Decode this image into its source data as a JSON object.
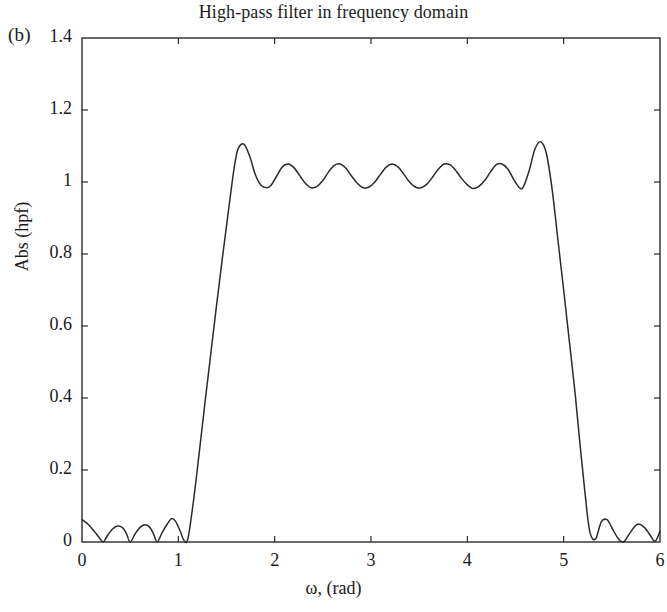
{
  "panel_label": "(b)",
  "axis_label_y": "Abs (hpf)",
  "axis_label_x": "ω, (rad)",
  "colors": {
    "line": "#2b2b2b",
    "frame": "#2b2b2b",
    "background": "#ffffff",
    "text": "#1a1a1a"
  },
  "chart_data": {
    "type": "line",
    "title": "High-pass filter in frequency domain",
    "xlabel": "ω, (rad)",
    "ylabel": "Abs (hpf)",
    "xlim": [
      0,
      6
    ],
    "ylim": [
      0,
      1.4
    ],
    "xticks": [
      0,
      1,
      2,
      3,
      4,
      5,
      6
    ],
    "xtick_labels": [
      "0",
      "1",
      "2",
      "3",
      "4",
      "5",
      "6"
    ],
    "yticks": [
      0,
      0.2,
      0.4,
      0.6,
      0.8,
      1,
      1.2,
      1.4
    ],
    "ytick_labels": [
      "0",
      "0.2",
      "0.4",
      "0.6",
      "0.8",
      "1",
      "1.2",
      "1.4"
    ],
    "grid": false,
    "legend": null,
    "series": [
      {
        "name": "Abs (hpf)",
        "x": [
          0.0,
          0.06,
          0.12,
          0.18,
          0.22,
          0.26,
          0.31,
          0.36,
          0.42,
          0.46,
          0.5,
          0.55,
          0.6,
          0.65,
          0.7,
          0.74,
          0.78,
          0.83,
          0.88,
          0.93,
          0.97,
          1.02,
          1.06,
          1.1,
          1.16,
          1.22,
          1.28,
          1.34,
          1.4,
          1.46,
          1.52,
          1.58,
          1.62,
          1.68,
          1.74,
          1.8,
          1.86,
          1.92,
          1.96,
          2.02,
          2.08,
          2.14,
          2.2,
          2.26,
          2.32,
          2.38,
          2.44,
          2.5,
          2.56,
          2.62,
          2.68,
          2.74,
          2.8,
          2.86,
          2.92,
          2.98,
          3.04,
          3.1,
          3.16,
          3.22,
          3.28,
          3.34,
          3.4,
          3.46,
          3.52,
          3.58,
          3.64,
          3.7,
          3.76,
          3.82,
          3.88,
          3.94,
          4.0,
          4.06,
          4.12,
          4.18,
          4.24,
          4.3,
          4.36,
          4.42,
          4.48,
          4.54,
          4.58,
          4.64,
          4.7,
          4.76,
          4.82,
          4.88,
          4.94,
          5.0,
          5.06,
          5.12,
          5.17,
          5.22,
          5.27,
          5.33,
          5.39,
          5.45,
          5.5,
          5.56,
          5.62,
          5.68,
          5.74,
          5.78,
          5.84,
          5.9,
          5.95,
          6.0
        ],
        "y": [
          0.062,
          0.05,
          0.032,
          0.012,
          0.0,
          0.016,
          0.034,
          0.044,
          0.04,
          0.024,
          0.0,
          0.022,
          0.04,
          0.048,
          0.042,
          0.024,
          0.0,
          0.025,
          0.048,
          0.065,
          0.058,
          0.03,
          0.004,
          0.01,
          0.12,
          0.255,
          0.395,
          0.53,
          0.665,
          0.795,
          0.92,
          1.04,
          1.092,
          1.105,
          1.072,
          1.02,
          0.99,
          0.984,
          0.99,
          1.016,
          1.042,
          1.05,
          1.04,
          1.018,
          0.996,
          0.984,
          0.988,
          1.004,
          1.028,
          1.046,
          1.05,
          1.038,
          1.016,
          0.996,
          0.984,
          0.986,
          1.0,
          1.022,
          1.042,
          1.05,
          1.042,
          1.022,
          1.0,
          0.986,
          0.984,
          0.994,
          1.014,
          1.036,
          1.05,
          1.048,
          1.032,
          1.01,
          0.992,
          0.982,
          0.988,
          1.004,
          1.028,
          1.048,
          1.05,
          1.036,
          1.008,
          0.984,
          0.986,
          1.03,
          1.09,
          1.112,
          1.08,
          0.98,
          0.84,
          0.7,
          0.555,
          0.41,
          0.27,
          0.14,
          0.03,
          0.008,
          0.056,
          0.062,
          0.04,
          0.012,
          0.0,
          0.022,
          0.044,
          0.05,
          0.04,
          0.018,
          0.002,
          0.03
        ],
        "description": "Magnitude response of high-pass FIR filter with equiripple passband (~1.0 ± 0.05) between ω ≈ 1.6 and 4.6 rad, transition bands near ω ≈ 1.1 and ω ≈ 5.1 rad, and sidelobe ripples below 0.07 in the stopbands"
      }
    ],
    "annotations": [
      {
        "text": "(b)",
        "position": "top-left-outside"
      }
    ]
  }
}
